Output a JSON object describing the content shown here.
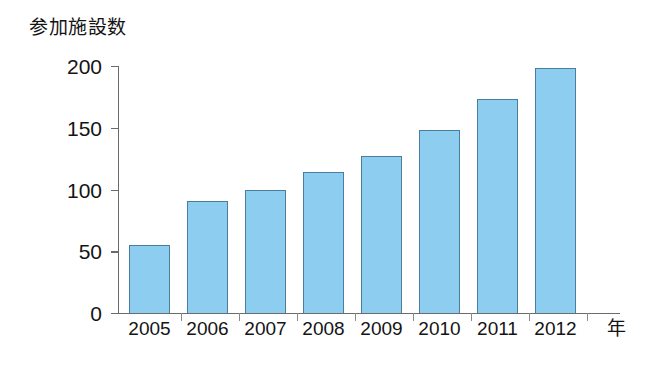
{
  "chart_data": {
    "type": "bar",
    "title": "参加施設数",
    "xlabel": "年",
    "ylabel": "参加施設数",
    "categories": [
      "2005",
      "2006",
      "2007",
      "2008",
      "2009",
      "2010",
      "2011",
      "2012"
    ],
    "values": [
      55,
      91,
      100,
      114,
      127,
      148,
      173,
      198
    ],
    "ylim": [
      0,
      200
    ],
    "yticks": [
      0,
      50,
      100,
      150,
      200
    ],
    "ytick_labels": [
      "0",
      "50",
      "100",
      "150",
      "200"
    ],
    "grid": false,
    "legend": null,
    "series": [
      {
        "name": "参加施設数",
        "values": [
          55,
          91,
          100,
          114,
          127,
          148,
          173,
          198
        ],
        "color": "#8ccdf0",
        "border_color": "#4a7e9e"
      }
    ],
    "annotations": []
  },
  "axes": {
    "y_title": "参加施設数",
    "x_unit": "年",
    "axis_color": "#6b6b6b"
  }
}
